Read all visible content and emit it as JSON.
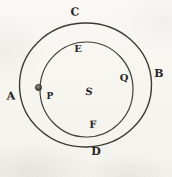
{
  "diagram": {
    "outer_circle_labels": {
      "left": "A",
      "right": "B",
      "top": "C",
      "bottom": "D"
    },
    "inner_circle_labels": {
      "top": "E",
      "bottom": "F",
      "right": "Q"
    },
    "center_label": "S",
    "point_label": "P",
    "colors": {
      "paper": "#f8f6f1",
      "line_ink": "#3e3a34",
      "letter_ink": "#28241f",
      "point_fill": "#575249"
    }
  }
}
